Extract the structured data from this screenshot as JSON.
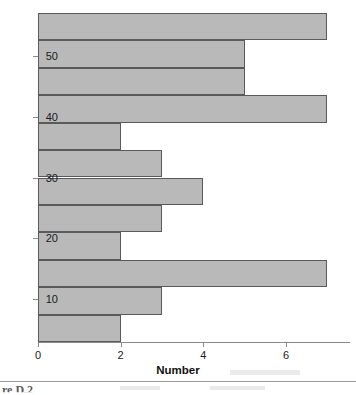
{
  "figure": {
    "caption_fragment": "re D.2"
  },
  "chart_data": {
    "type": "bar",
    "orientation": "horizontal",
    "title": "",
    "subtitle": "",
    "xlabel": "Number",
    "ylabel": "",
    "xlim": [
      0,
      7.5
    ],
    "ylim": [
      3,
      57
    ],
    "xticks": [
      0,
      2,
      4,
      6
    ],
    "xticklabels": [
      "0",
      "2",
      "4",
      "6"
    ],
    "yticks": [
      10,
      20,
      30,
      40,
      50
    ],
    "yticklabels": [
      "10",
      "20",
      "30",
      "40",
      "50"
    ],
    "grid": false,
    "legend": null,
    "bar_color": "#b9b9b9",
    "bar_edge_color": "#5a5a5a",
    "bin_width": 4.5,
    "bins": [
      {
        "label": "52.5-57",
        "y_center": 54.75,
        "y_low": 52.5,
        "y_high": 57.0,
        "value": 7
      },
      {
        "label": "48-52.5",
        "y_center": 50.25,
        "y_low": 48.0,
        "y_high": 52.5,
        "value": 5
      },
      {
        "label": "43.5-48",
        "y_center": 45.75,
        "y_low": 43.5,
        "y_high": 48.0,
        "value": 5
      },
      {
        "label": "39-43.5",
        "y_center": 41.25,
        "y_low": 39.0,
        "y_high": 43.5,
        "value": 7
      },
      {
        "label": "34.5-39",
        "y_center": 36.75,
        "y_low": 34.5,
        "y_high": 39.0,
        "value": 2
      },
      {
        "label": "30-34.5",
        "y_center": 32.25,
        "y_low": 30.0,
        "y_high": 34.5,
        "value": 3
      },
      {
        "label": "25.5-30",
        "y_center": 27.75,
        "y_low": 25.5,
        "y_high": 30.0,
        "value": 4
      },
      {
        "label": "21-25.5",
        "y_center": 23.25,
        "y_low": 21.0,
        "y_high": 25.5,
        "value": 3
      },
      {
        "label": "16.5-21",
        "y_center": 18.75,
        "y_low": 16.5,
        "y_high": 21.0,
        "value": 2
      },
      {
        "label": "12-16.5",
        "y_center": 14.25,
        "y_low": 12.0,
        "y_high": 16.5,
        "value": 7
      },
      {
        "label": "7.5-12",
        "y_center": 9.75,
        "y_low": 7.5,
        "y_high": 12.0,
        "value": 3
      },
      {
        "label": "3-7.5",
        "y_center": 5.25,
        "y_low": 3.0,
        "y_high": 7.5,
        "value": 2
      }
    ],
    "values": [
      7,
      5,
      5,
      7,
      2,
      3,
      4,
      3,
      2,
      7,
      3,
      2
    ],
    "categories": [
      "52.5-57",
      "48-52.5",
      "43.5-48",
      "39-43.5",
      "34.5-39",
      "30-34.5",
      "25.5-30",
      "21-25.5",
      "16.5-21",
      "12-16.5",
      "7.5-12",
      "3-7.5"
    ]
  }
}
